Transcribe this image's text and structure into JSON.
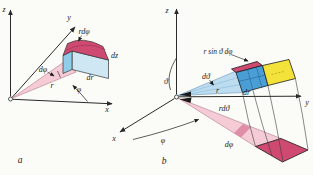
{
  "figure": {
    "panel_a": {
      "panel_label": "a",
      "axis_x": "x",
      "axis_y": "y",
      "axis_z": "z",
      "label_r_dphi": "rdφ",
      "label_dz": "dz",
      "label_dr": "dr",
      "label_dphi": "dφ",
      "label_r": "r",
      "label_phi": "φ"
    },
    "panel_b": {
      "panel_label": "b",
      "axis_x": "x",
      "axis_y": "y",
      "axis_z": "z",
      "label_r_sin_theta_dphi": "r sin ϑ dφ",
      "label_dtheta": "dϑ",
      "label_theta": "ϑ",
      "label_r": "r",
      "label_dr": "dr",
      "label_r_dtheta": "rdϑ",
      "label_dphi": "dφ",
      "label_phi": "φ"
    },
    "colors": {
      "crimson": "#ce4a71",
      "crimson_band": "#de8ea6",
      "pink": "#f5ccd6",
      "light_blue": "#cfe7f3",
      "wedge_blue": "#bddcf0",
      "cyan": "#8fcde8",
      "medium_blue": "#4a9ed6",
      "yellow": "#f3e23a",
      "ink": "#2a2a2a"
    }
  }
}
